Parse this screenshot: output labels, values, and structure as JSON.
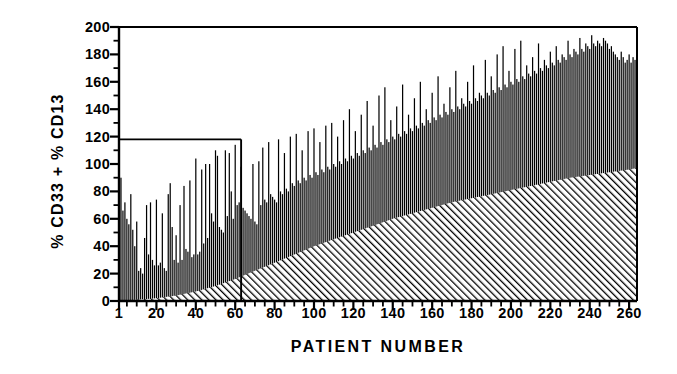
{
  "chart_data": {
    "type": "bar",
    "title": "",
    "xlabel": "PATIENT NUMBER",
    "ylabel": "% CD33 + % CD13",
    "xlim": [
      1,
      264
    ],
    "ylim": [
      0,
      200
    ],
    "grid": false,
    "legend": null,
    "y_ticks_major": [
      0,
      20,
      40,
      60,
      80,
      100,
      120,
      140,
      160,
      180,
      200
    ],
    "y_tick_labels": [
      "0",
      "20",
      "40",
      "60",
      "80",
      "100",
      "120",
      "140",
      "160",
      "180",
      "200"
    ],
    "y_minor_tick_step": 10,
    "x_ticks_major": [
      1,
      20,
      40,
      60,
      80,
      100,
      120,
      140,
      160,
      180,
      200,
      220,
      240,
      260
    ],
    "x_tick_labels": [
      "1",
      "20",
      "40",
      "60",
      "80",
      "100",
      "120",
      "140",
      "160",
      "180",
      "200",
      "220",
      "240",
      "260"
    ],
    "x_minor_tick_step": 5,
    "series_name": "Total % CD33 + % CD13 per patient",
    "bar_color": "#000000",
    "bar_edge_color": "#000000",
    "axis_color": "#000000",
    "background_color": "#ffffff",
    "annotation_box": {
      "name": "inset-reference-box",
      "x_range": [
        1,
        63
      ],
      "y_range": [
        0,
        118
      ],
      "stroke": "#000000",
      "description": "rectangle outline from the y-axis to patient 63 at the 118 level"
    },
    "shaded_region": {
      "name": "hatched-cumulative-region",
      "pattern": "diagonal-hatch-45",
      "color": "#000000",
      "description": "hatched area under a monotonically rising sorted-value curve",
      "curve_x": [
        1,
        10,
        20,
        30,
        40,
        50,
        60,
        70,
        80,
        90,
        100,
        110,
        120,
        130,
        140,
        150,
        160,
        170,
        180,
        190,
        200,
        210,
        220,
        230,
        240,
        250,
        260,
        264
      ],
      "curve_y": [
        0,
        1,
        2,
        4,
        7,
        11,
        16,
        22,
        28,
        34,
        40,
        45,
        50,
        55,
        60,
        64,
        68,
        72,
        75,
        78,
        81,
        84,
        87,
        90,
        92,
        94,
        96,
        97
      ]
    },
    "categories": [
      1,
      2,
      3,
      4,
      5,
      6,
      7,
      8,
      9,
      10,
      11,
      12,
      13,
      14,
      15,
      16,
      17,
      18,
      19,
      20,
      21,
      22,
      23,
      24,
      25,
      26,
      27,
      28,
      29,
      30,
      31,
      32,
      33,
      34,
      35,
      36,
      37,
      38,
      39,
      40,
      41,
      42,
      43,
      44,
      45,
      46,
      47,
      48,
      49,
      50,
      51,
      52,
      53,
      54,
      55,
      56,
      57,
      58,
      59,
      60,
      61,
      62,
      63,
      64,
      65,
      66,
      67,
      68,
      69,
      70,
      71,
      72,
      73,
      74,
      75,
      76,
      77,
      78,
      79,
      80,
      81,
      82,
      83,
      84,
      85,
      86,
      87,
      88,
      89,
      90,
      91,
      92,
      93,
      94,
      95,
      96,
      97,
      98,
      99,
      100,
      101,
      102,
      103,
      104,
      105,
      106,
      107,
      108,
      109,
      110,
      111,
      112,
      113,
      114,
      115,
      116,
      117,
      118,
      119,
      120,
      121,
      122,
      123,
      124,
      125,
      126,
      127,
      128,
      129,
      130,
      131,
      132,
      133,
      134,
      135,
      136,
      137,
      138,
      139,
      140,
      141,
      142,
      143,
      144,
      145,
      146,
      147,
      148,
      149,
      150,
      151,
      152,
      153,
      154,
      155,
      156,
      157,
      158,
      159,
      160,
      161,
      162,
      163,
      164,
      165,
      166,
      167,
      168,
      169,
      170,
      171,
      172,
      173,
      174,
      175,
      176,
      177,
      178,
      179,
      180,
      181,
      182,
      183,
      184,
      185,
      186,
      187,
      188,
      189,
      190,
      191,
      192,
      193,
      194,
      195,
      196,
      197,
      198,
      199,
      200,
      201,
      202,
      203,
      204,
      205,
      206,
      207,
      208,
      209,
      210,
      211,
      212,
      213,
      214,
      215,
      216,
      217,
      218,
      219,
      220,
      221,
      222,
      223,
      224,
      225,
      226,
      227,
      228,
      229,
      230,
      231,
      232,
      233,
      234,
      235,
      236,
      237,
      238,
      239,
      240,
      241,
      242,
      243,
      244,
      245,
      246,
      247,
      248,
      249,
      250,
      251,
      252,
      253,
      254,
      255,
      256,
      257,
      258,
      259,
      260,
      261,
      262,
      263
    ],
    "values": [
      82,
      90,
      66,
      72,
      60,
      56,
      78,
      52,
      40,
      58,
      22,
      24,
      20,
      46,
      70,
      34,
      72,
      30,
      26,
      74,
      26,
      28,
      64,
      24,
      22,
      78,
      86,
      54,
      30,
      48,
      28,
      70,
      30,
      84,
      38,
      36,
      88,
      32,
      34,
      104,
      34,
      36,
      96,
      42,
      100,
      46,
      100,
      64,
      58,
      110,
      106,
      54,
      52,
      50,
      110,
      62,
      108,
      80,
      60,
      114,
      70,
      72,
      98,
      68,
      66,
      64,
      62,
      60,
      100,
      58,
      56,
      102,
      70,
      112,
      74,
      72,
      116,
      78,
      76,
      74,
      72,
      118,
      80,
      78,
      108,
      82,
      80,
      120,
      86,
      84,
      122,
      88,
      86,
      110,
      90,
      88,
      124,
      92,
      90,
      126,
      94,
      92,
      116,
      96,
      94,
      128,
      98,
      96,
      130,
      100,
      98,
      120,
      102,
      100,
      132,
      104,
      102,
      140,
      106,
      104,
      124,
      108,
      106,
      136,
      110,
      108,
      146,
      112,
      110,
      128,
      114,
      112,
      150,
      116,
      114,
      156,
      118,
      116,
      132,
      120,
      118,
      142,
      122,
      120,
      158,
      124,
      122,
      136,
      126,
      124,
      148,
      128,
      126,
      160,
      130,
      128,
      140,
      132,
      130,
      152,
      134,
      132,
      164,
      136,
      134,
      144,
      138,
      136,
      156,
      140,
      138,
      168,
      142,
      140,
      148,
      144,
      142,
      160,
      146,
      144,
      172,
      148,
      146,
      152,
      150,
      148,
      176,
      152,
      150,
      164,
      154,
      152,
      180,
      156,
      154,
      186,
      158,
      156,
      168,
      160,
      158,
      184,
      162,
      160,
      190,
      164,
      162,
      172,
      166,
      164,
      178,
      168,
      166,
      188,
      170,
      168,
      176,
      172,
      170,
      182,
      174,
      172,
      186,
      176,
      174,
      180,
      178,
      176,
      190,
      180,
      178,
      184,
      182,
      180,
      192,
      184,
      182,
      188,
      186,
      184,
      194,
      188,
      186,
      190,
      188,
      186,
      192,
      190,
      188,
      184,
      186,
      182,
      180,
      178,
      176,
      182,
      178,
      174,
      176,
      180,
      174,
      178,
      176
    ]
  }
}
